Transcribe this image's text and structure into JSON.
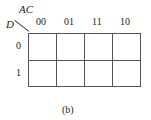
{
  "kmap": {
    "column_variables": "AC",
    "row_variable": "D",
    "column_labels": [
      "00",
      "01",
      "11",
      "10"
    ],
    "row_labels": [
      "0",
      "1"
    ],
    "cells": [
      [
        "",
        "",
        "",
        ""
      ],
      [
        "",
        "",
        "",
        ""
      ]
    ]
  },
  "caption": "(b)"
}
